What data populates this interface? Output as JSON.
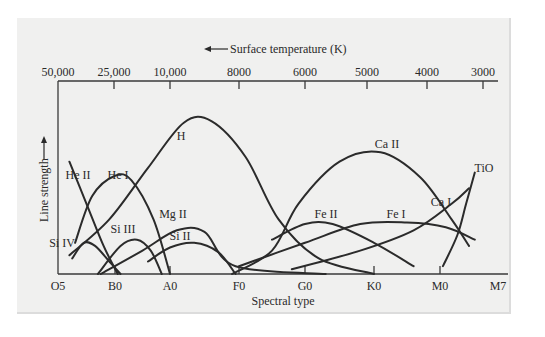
{
  "chart_data": {
    "type": "line",
    "title": "",
    "top_axis": {
      "label": "Surface temperature (K)",
      "arrow": "left",
      "ticks": [
        "50,000",
        "25,000",
        "10,000",
        "8000",
        "6000",
        "5000",
        "4000",
        "3000"
      ]
    },
    "xlabel": "Spectral type",
    "ylabel": "Line strength",
    "x_ticks": [
      "O5",
      "B0",
      "A0",
      "F0",
      "G0",
      "K0",
      "M0",
      "M7"
    ],
    "y_range": [
      0,
      1
    ],
    "grid": false,
    "x_units": "spectral index (O5=0, B0=1, A0=2, F0=3, G0=4, K0=5, M0=6, M7=7)",
    "series": [
      {
        "name": "He II",
        "points": [
          [
            0.2,
            0.72
          ],
          [
            0.5,
            0.45
          ],
          [
            0.8,
            0.18
          ],
          [
            1.05,
            0.0
          ]
        ]
      },
      {
        "name": "He I",
        "points": [
          [
            0.3,
            0.2
          ],
          [
            0.6,
            0.5
          ],
          [
            1.0,
            0.63
          ],
          [
            1.3,
            0.6
          ],
          [
            1.7,
            0.35
          ],
          [
            2.0,
            0.0
          ]
        ]
      },
      {
        "name": "Si IV",
        "points": [
          [
            0.25,
            0.1
          ],
          [
            0.45,
            0.2
          ],
          [
            0.65,
            0.18
          ],
          [
            0.9,
            0.08
          ],
          [
            1.1,
            0.0
          ]
        ]
      },
      {
        "name": "Si III",
        "points": [
          [
            0.7,
            0.0
          ],
          [
            1.1,
            0.18
          ],
          [
            1.4,
            0.22
          ],
          [
            1.65,
            0.15
          ],
          [
            1.85,
            0.0
          ]
        ]
      },
      {
        "name": "H",
        "points": [
          [
            0.2,
            0.12
          ],
          [
            0.9,
            0.35
          ],
          [
            1.6,
            0.68
          ],
          [
            2.2,
            0.97
          ],
          [
            2.6,
            0.98
          ],
          [
            3.1,
            0.75
          ],
          [
            3.6,
            0.35
          ],
          [
            4.2,
            0.1
          ],
          [
            5.0,
            0.0
          ]
        ]
      },
      {
        "name": "Mg II",
        "points": [
          [
            0.75,
            0.0
          ],
          [
            1.5,
            0.15
          ],
          [
            2.1,
            0.28
          ],
          [
            2.5,
            0.27
          ],
          [
            2.95,
            0.05
          ],
          [
            4.3,
            0.0
          ]
        ]
      },
      {
        "name": "Si II",
        "points": [
          [
            1.6,
            0.08
          ],
          [
            2.0,
            0.17
          ],
          [
            2.35,
            0.2
          ],
          [
            2.7,
            0.14
          ],
          [
            2.95,
            0.0
          ]
        ]
      },
      {
        "name": "Ca II",
        "points": [
          [
            2.9,
            0.0
          ],
          [
            3.5,
            0.15
          ],
          [
            3.9,
            0.45
          ],
          [
            4.5,
            0.72
          ],
          [
            5.1,
            0.78
          ],
          [
            5.7,
            0.62
          ],
          [
            6.2,
            0.35
          ],
          [
            6.5,
            0.18
          ]
        ]
      },
      {
        "name": "Fe II",
        "points": [
          [
            3.5,
            0.22
          ],
          [
            4.0,
            0.32
          ],
          [
            4.4,
            0.32
          ],
          [
            5.0,
            0.2
          ],
          [
            5.6,
            0.05
          ]
        ]
      },
      {
        "name": "Fe I",
        "points": [
          [
            3.0,
            0.05
          ],
          [
            4.0,
            0.2
          ],
          [
            4.8,
            0.32
          ],
          [
            5.5,
            0.33
          ],
          [
            6.1,
            0.3
          ],
          [
            6.6,
            0.22
          ]
        ]
      },
      {
        "name": "Ca I",
        "points": [
          [
            3.8,
            0.03
          ],
          [
            4.8,
            0.15
          ],
          [
            5.6,
            0.28
          ],
          [
            6.2,
            0.45
          ],
          [
            6.5,
            0.55
          ]
        ]
      },
      {
        "name": "TiO",
        "points": [
          [
            6.05,
            0.05
          ],
          [
            6.3,
            0.25
          ],
          [
            6.45,
            0.45
          ],
          [
            6.6,
            0.65
          ]
        ]
      }
    ]
  }
}
